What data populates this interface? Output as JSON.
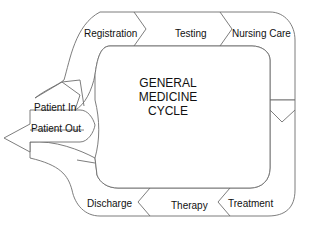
{
  "diagram": {
    "title_lines": [
      "GENERAL",
      "MEDICINE",
      "CYCLE"
    ],
    "steps": [
      {
        "label": "Registration"
      },
      {
        "label": "Testing"
      },
      {
        "label": "Nursing Care"
      },
      {
        "label": "Treatment"
      },
      {
        "label": "Therapy"
      },
      {
        "label": "Discharge"
      }
    ],
    "entry_label": "Patient In",
    "exit_label": "Patient Out",
    "colors": {
      "stroke": "#6e6e6e",
      "fill": "#ffffff",
      "text": "#111111"
    }
  }
}
